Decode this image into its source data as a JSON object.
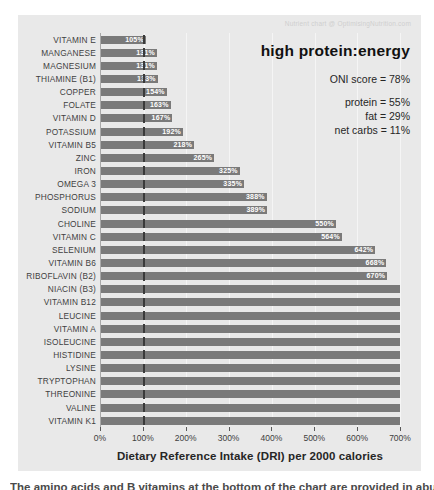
{
  "watermark": "Nutrient chart @ OptimisingNutrition.com",
  "panel": {
    "title": "high protein:energy",
    "oni_score": "ONI score = 78%",
    "macros": [
      "protein = 55%",
      "fat = 29%",
      "net carbs = 11%"
    ]
  },
  "chart_data": {
    "type": "bar",
    "orientation": "horizontal",
    "title": "high protein:energy",
    "xlabel": "Dietary Reference Intake (DRI) per 2000 calories",
    "xlim": [
      0,
      700
    ],
    "x_ticks": [
      "0%",
      "100%",
      "200%",
      "300%",
      "400%",
      "500%",
      "600%",
      "700%"
    ],
    "grid": true,
    "reference_line_pct": 100,
    "bar_color": "#7a7a7a",
    "clipped_note": "bars from NIACIN (B3) downward reach or exceed 700% and are clipped at the axis maximum",
    "categories": [
      "VITAMIN E",
      "MANGANESE",
      "MAGNESIUM",
      "THIAMINE (B1)",
      "COPPER",
      "FOLATE",
      "VITAMIN D",
      "POTASSIUM",
      "VITAMIN B5",
      "ZINC",
      "IRON",
      "OMEGA 3",
      "PHOSPHORUS",
      "SODIUM",
      "CHOLINE",
      "VITAMIN C",
      "SELENIUM",
      "VITAMIN B6",
      "RIBOFLAVIN (B2)",
      "NIACIN (B3)",
      "VITAMIN B12",
      "LEUCINE",
      "VITAMIN A",
      "ISOLEUCINE",
      "HISTIDINE",
      "LYSINE",
      "TRYPTOPHAN",
      "THREONINE",
      "VALINE",
      "VITAMIN K1"
    ],
    "values": [
      105,
      131,
      131,
      133,
      154,
      163,
      167,
      192,
      218,
      265,
      325,
      335,
      388,
      389,
      550,
      564,
      642,
      668,
      670,
      700,
      700,
      700,
      700,
      700,
      700,
      700,
      700,
      700,
      700,
      700
    ],
    "labels": [
      "105%",
      "131%",
      "131%",
      "133%",
      "154%",
      "163%",
      "167%",
      "192%",
      "218%",
      "265%",
      "325%",
      "335%",
      "388%",
      "389%",
      "550%",
      "564%",
      "642%",
      "668%",
      "670%",
      "",
      "",
      "",
      "",
      "",
      "",
      "",
      "",
      "",
      "",
      ""
    ],
    "clipped": [
      false,
      false,
      false,
      false,
      false,
      false,
      false,
      false,
      false,
      false,
      false,
      false,
      false,
      false,
      false,
      false,
      false,
      false,
      false,
      true,
      true,
      true,
      true,
      true,
      true,
      true,
      true,
      true,
      true,
      true
    ]
  },
  "bottom_caption": "The amino acids and B vitamins at the bottom of the chart are provided in abundance by a high protein:energy diet."
}
